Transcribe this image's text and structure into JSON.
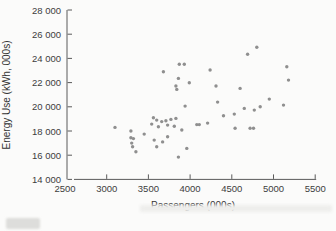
{
  "chart_data": {
    "type": "scatter",
    "title": "",
    "xlabel": "Passengers (000s)",
    "ylabel": "Energy Use (kWh, 000s)",
    "xlim": [
      2500,
      5500
    ],
    "ylim": [
      14000,
      28000
    ],
    "x_ticks": [
      2500,
      3000,
      3500,
      4000,
      4500,
      5000,
      5500
    ],
    "y_ticks": [
      14000,
      16000,
      18000,
      20000,
      22000,
      24000,
      26000,
      28000
    ],
    "y_tick_labels": [
      "14 000",
      "16 000",
      "18 000",
      "20 000",
      "22 000",
      "24 000",
      "26 000",
      "28 000"
    ],
    "grid": false,
    "legend": null,
    "colors": {
      "point": "#8f8f8f",
      "axis": "#5a5a5a",
      "tick_text": "#3d3d3d"
    },
    "points": [
      [
        3100,
        18300
      ],
      [
        3290,
        18000
      ],
      [
        3290,
        17450
      ],
      [
        3320,
        17370
      ],
      [
        3300,
        17000
      ],
      [
        3310,
        16700
      ],
      [
        3350,
        16280
      ],
      [
        3450,
        17740
      ],
      [
        3540,
        18570
      ],
      [
        3560,
        19100
      ],
      [
        3600,
        18900
      ],
      [
        3570,
        17250
      ],
      [
        3600,
        16700
      ],
      [
        3620,
        18350
      ],
      [
        3660,
        18780
      ],
      [
        3670,
        17100
      ],
      [
        3710,
        18850
      ],
      [
        3730,
        18490
      ],
      [
        3770,
        18960
      ],
      [
        3810,
        18400
      ],
      [
        3830,
        19040
      ],
      [
        3730,
        17520
      ],
      [
        3860,
        15840
      ],
      [
        3900,
        18080
      ],
      [
        3940,
        20060
      ],
      [
        3960,
        16560
      ],
      [
        3680,
        22900
      ],
      [
        3870,
        23510
      ],
      [
        3930,
        23510
      ],
      [
        3860,
        22350
      ],
      [
        3830,
        21720
      ],
      [
        3840,
        21440
      ],
      [
        3990,
        21990
      ],
      [
        4080,
        18530
      ],
      [
        4110,
        18530
      ],
      [
        4210,
        18650
      ],
      [
        4240,
        23040
      ],
      [
        4310,
        21720
      ],
      [
        4330,
        20390
      ],
      [
        4400,
        19260
      ],
      [
        4530,
        19400
      ],
      [
        4540,
        18220
      ],
      [
        4600,
        21520
      ],
      [
        4650,
        19870
      ],
      [
        4690,
        24340
      ],
      [
        4720,
        18220
      ],
      [
        4760,
        18220
      ],
      [
        4770,
        19730
      ],
      [
        4800,
        24920
      ],
      [
        4840,
        20000
      ],
      [
        4950,
        20640
      ],
      [
        5120,
        20140
      ],
      [
        5160,
        23310
      ],
      [
        5180,
        22210
      ]
    ]
  }
}
